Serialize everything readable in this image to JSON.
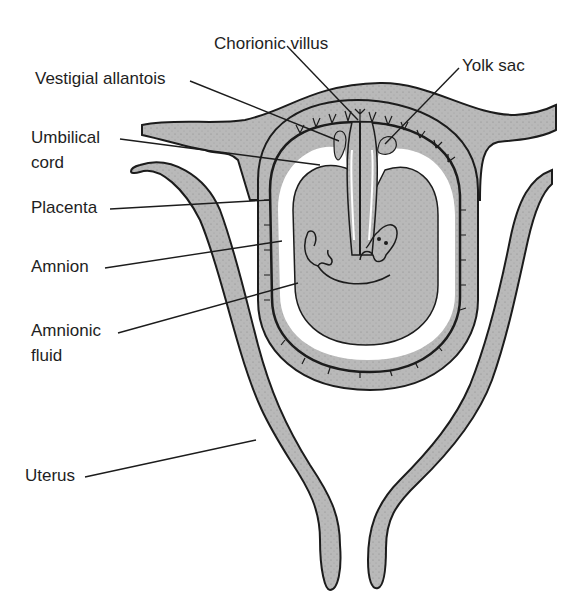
{
  "diagram": {
    "colors": {
      "tissue": "#b9b9b9",
      "outline": "#1c1c1c",
      "cavity": "#ffffff",
      "background": "#ffffff"
    },
    "labels": {
      "chorionic_villus": "Chorionic villus",
      "vestigial_allantois": "Vestigial allantois",
      "yolk_sac": "Yolk sac",
      "umbilical_cord_line1": "Umbilical",
      "umbilical_cord_line2": "cord",
      "placenta": "Placenta",
      "amnion": "Amnion",
      "amnionic_fluid_line1": "Amnionic",
      "amnionic_fluid_line2": "fluid",
      "uterus": "Uterus"
    }
  }
}
